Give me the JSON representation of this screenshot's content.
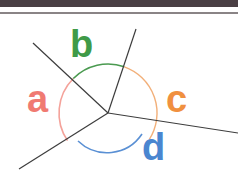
{
  "diagram": {
    "center": [
      108,
      113
    ],
    "radius": 49,
    "lines": [
      {
        "name": "ray-upper-left",
        "to": [
          33,
          43
        ]
      },
      {
        "name": "ray-upper",
        "to": [
          136,
          29
        ]
      },
      {
        "name": "ray-right",
        "to": [
          238,
          133
        ]
      },
      {
        "name": "ray-lower-left",
        "to": [
          19,
          169
        ]
      }
    ],
    "angles": [
      {
        "label": "a",
        "color": "#f07a72",
        "pos": [
          27,
          80
        ],
        "size": 36
      },
      {
        "label": "b",
        "color": "#3f9a48",
        "pos": [
          70,
          26
        ],
        "size": 36
      },
      {
        "label": "c",
        "color": "#f09040",
        "pos": [
          166,
          80
        ],
        "size": 36
      },
      {
        "label": "d",
        "color": "#4a86d0",
        "pos": [
          142,
          130
        ],
        "size": 36
      }
    ],
    "line_color": "#3c3c3c"
  }
}
